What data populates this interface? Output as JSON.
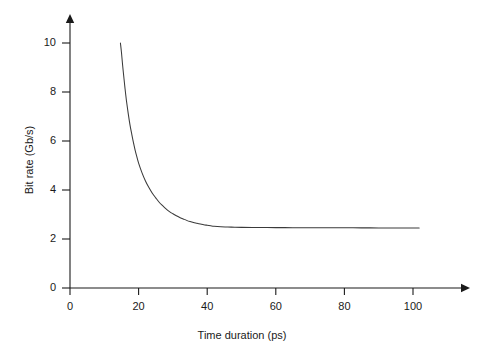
{
  "chart_data": {
    "type": "line",
    "title": "",
    "subtitle": "",
    "xlabel": "Time duration (ps)",
    "ylabel": "Bit rate (Gb/s)",
    "xlim": [
      0,
      110
    ],
    "ylim": [
      0,
      11
    ],
    "xticks": [
      0,
      20,
      40,
      60,
      80,
      100
    ],
    "xticklabels": [
      "0",
      "20",
      "40",
      "60",
      "80",
      "100"
    ],
    "yticks": [
      0,
      2,
      4,
      6,
      8,
      10
    ],
    "yticklabels": [
      "0",
      "2",
      "4",
      "6",
      "8",
      "10"
    ],
    "grid": false,
    "legend": false,
    "legend_position": "none",
    "annotations": [],
    "line_color": "#3a3a3a",
    "axis_color": "#1a1a1a",
    "background_color": "#ffffff",
    "series": [
      {
        "name": "bit rate vs time duration",
        "x": [
          14.7,
          15.0,
          15.3,
          15.7,
          16.0,
          16.5,
          17.0,
          17.5,
          18.0,
          18.5,
          19.0,
          19.5,
          20.0,
          21.0,
          22.0,
          23.0,
          24.0,
          25.0,
          26.0,
          27.0,
          28.0,
          29.0,
          30.0,
          31.0,
          32.0,
          33.0,
          34.0,
          35.0,
          36.0,
          37.0,
          38.0,
          39.0,
          40.0,
          41.0,
          42.0,
          44.0,
          46.0,
          48.0,
          50.0,
          55.0,
          60.0,
          65.0,
          70.0,
          75.0,
          80.0,
          85.0,
          90.0,
          95.0,
          100.0,
          101.8
        ],
        "y": [
          10.0,
          9.62,
          9.15,
          8.6,
          8.2,
          7.6,
          7.1,
          6.65,
          6.28,
          5.93,
          5.62,
          5.35,
          5.1,
          4.7,
          4.37,
          4.1,
          3.87,
          3.68,
          3.5,
          3.36,
          3.23,
          3.12,
          3.03,
          2.95,
          2.88,
          2.82,
          2.76,
          2.71,
          2.67,
          2.64,
          2.61,
          2.58,
          2.56,
          2.54,
          2.52,
          2.5,
          2.49,
          2.48,
          2.475,
          2.47,
          2.465,
          2.462,
          2.46,
          2.458,
          2.456,
          2.455,
          2.453,
          2.452,
          2.45,
          2.45
        ]
      }
    ]
  },
  "axes_geometry": {
    "origin_x_px": 70,
    "origin_y_px": 288,
    "x_px_per_unit": 3.43,
    "y_px_per_unit": 24.5,
    "x_axis_end_px": 470,
    "y_axis_top_px": 14
  }
}
